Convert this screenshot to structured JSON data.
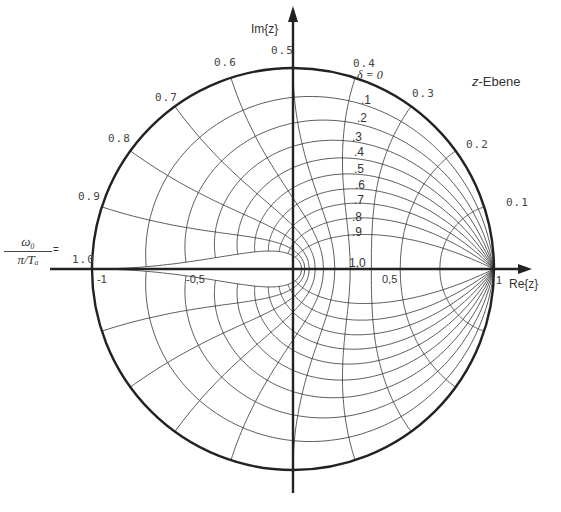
{
  "title": "z-Ebene",
  "title_plane_letter": "z",
  "title_plane_suffix": "-Ebene",
  "axes": {
    "x_label": "Re{z}",
    "y_label": "Im{z}",
    "x_ticks": [
      "-1",
      "-0,5",
      "0,5",
      "1"
    ],
    "center_label": "1,0"
  },
  "freq_label": {
    "numerator": "ω₀",
    "denominator": "π/Tₐ",
    "suffix": "="
  },
  "damping_header": "δ = 0",
  "chart_data": {
    "type": "line",
    "title": "z-Ebene",
    "xlabel": "Re{z}",
    "ylabel": "Im{z}",
    "xlim": [
      -1,
      1
    ],
    "ylim": [
      -1,
      1
    ],
    "grid": false,
    "unit_circle": true,
    "damping_values": [
      0,
      0.1,
      0.2,
      0.3,
      0.4,
      0.5,
      0.6,
      0.7,
      0.8,
      0.9,
      1.0
    ],
    "damping_labels": [
      "δ = 0",
      ".1",
      ".2",
      ".3",
      ".4",
      ".5",
      ".6",
      ".7",
      ".8",
      ".9",
      "1,0"
    ],
    "normalized_frequency_values": [
      0.1,
      0.2,
      0.3,
      0.4,
      0.5,
      0.6,
      0.7,
      0.8,
      0.9,
      1.0
    ],
    "normalized_frequency_labels": [
      "0.1",
      "0.2",
      "0.3",
      "0.4",
      "0.5",
      "0.6",
      "0.7",
      "0.8",
      "0.9",
      "1.0"
    ],
    "frequency_variable": "ω₀ / (π/Tₐ)"
  },
  "colors": {
    "line": "#222222",
    "grid": "#333333",
    "text": "#444444",
    "background": "#ffffff"
  }
}
